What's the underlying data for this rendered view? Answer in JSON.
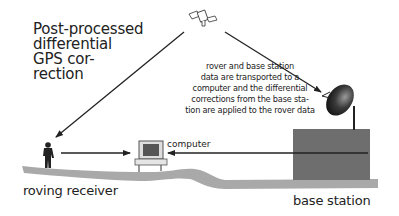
{
  "title": {
    "lines": [
      "Post-processed",
      "differential",
      "GPS cor-",
      "rection"
    ]
  },
  "note": {
    "lines": [
      "rover and base station",
      "data are transported to a",
      "computer and the differential",
      "corrections from the base sta-",
      "tion are applied to the rover data"
    ]
  },
  "labels": {
    "roving_receiver": "roving receiver",
    "base_station": "base station",
    "computer": "computer"
  },
  "icons": {
    "satellite": "satellite-icon",
    "person": "person-icon",
    "computer": "computer-icon",
    "dish": "satellite-dish-icon",
    "building": "base-station-building"
  },
  "colors": {
    "ground": "#a9a9a9",
    "building": "#6e6e6e",
    "line": "#222222",
    "text": "#222222"
  }
}
